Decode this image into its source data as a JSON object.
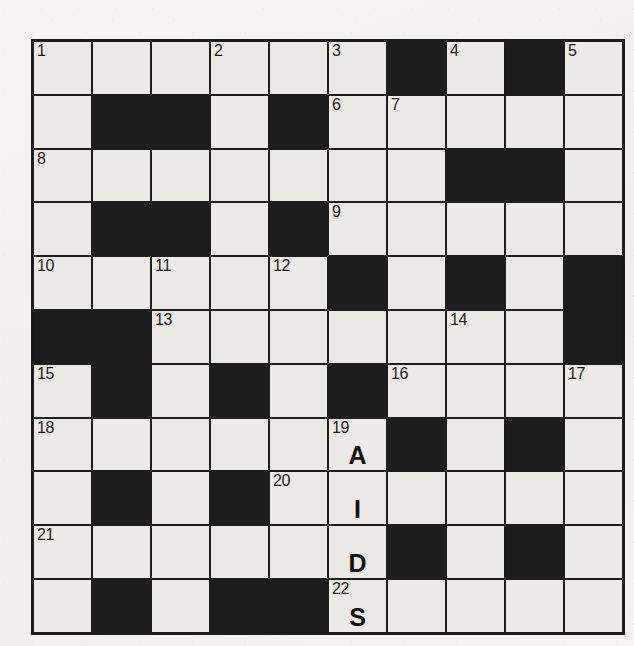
{
  "puzzle": {
    "title": "crossword-grid",
    "rows": 11,
    "cols": 10,
    "colors": {
      "block": "#1d1d1d",
      "cell": "#eceae6",
      "grid_line": "#1c1c1c",
      "paper": "#f3f2f0",
      "text": "#111111"
    },
    "filled_answer": "AIDS",
    "grid": [
      [
        {
          "block": false,
          "num": "1",
          "letter": ""
        },
        {
          "block": false,
          "num": "",
          "letter": ""
        },
        {
          "block": false,
          "num": "",
          "letter": ""
        },
        {
          "block": false,
          "num": "2",
          "letter": ""
        },
        {
          "block": false,
          "num": "",
          "letter": ""
        },
        {
          "block": false,
          "num": "3",
          "letter": ""
        },
        {
          "block": true,
          "num": "",
          "letter": ""
        },
        {
          "block": false,
          "num": "4",
          "letter": ""
        },
        {
          "block": true,
          "num": "",
          "letter": ""
        },
        {
          "block": false,
          "num": "5",
          "letter": ""
        }
      ],
      [
        {
          "block": false,
          "num": "",
          "letter": ""
        },
        {
          "block": true,
          "num": "",
          "letter": ""
        },
        {
          "block": true,
          "num": "",
          "letter": ""
        },
        {
          "block": false,
          "num": "",
          "letter": ""
        },
        {
          "block": true,
          "num": "",
          "letter": ""
        },
        {
          "block": false,
          "num": "6",
          "letter": ""
        },
        {
          "block": false,
          "num": "7",
          "letter": ""
        },
        {
          "block": false,
          "num": "",
          "letter": ""
        },
        {
          "block": false,
          "num": "",
          "letter": ""
        },
        {
          "block": false,
          "num": "",
          "letter": ""
        }
      ],
      [
        {
          "block": false,
          "num": "8",
          "letter": ""
        },
        {
          "block": false,
          "num": "",
          "letter": ""
        },
        {
          "block": false,
          "num": "",
          "letter": ""
        },
        {
          "block": false,
          "num": "",
          "letter": ""
        },
        {
          "block": false,
          "num": "",
          "letter": ""
        },
        {
          "block": false,
          "num": "",
          "letter": ""
        },
        {
          "block": false,
          "num": "",
          "letter": ""
        },
        {
          "block": true,
          "num": "",
          "letter": ""
        },
        {
          "block": true,
          "num": "",
          "letter": ""
        },
        {
          "block": false,
          "num": "",
          "letter": ""
        }
      ],
      [
        {
          "block": false,
          "num": "",
          "letter": ""
        },
        {
          "block": true,
          "num": "",
          "letter": ""
        },
        {
          "block": true,
          "num": "",
          "letter": ""
        },
        {
          "block": false,
          "num": "",
          "letter": ""
        },
        {
          "block": true,
          "num": "",
          "letter": ""
        },
        {
          "block": false,
          "num": "9",
          "letter": ""
        },
        {
          "block": false,
          "num": "",
          "letter": ""
        },
        {
          "block": false,
          "num": "",
          "letter": ""
        },
        {
          "block": false,
          "num": "",
          "letter": ""
        },
        {
          "block": false,
          "num": "",
          "letter": ""
        }
      ],
      [
        {
          "block": false,
          "num": "10",
          "letter": ""
        },
        {
          "block": false,
          "num": "",
          "letter": ""
        },
        {
          "block": false,
          "num": "11",
          "letter": ""
        },
        {
          "block": false,
          "num": "",
          "letter": ""
        },
        {
          "block": false,
          "num": "12",
          "letter": ""
        },
        {
          "block": true,
          "num": "",
          "letter": ""
        },
        {
          "block": false,
          "num": "",
          "letter": ""
        },
        {
          "block": true,
          "num": "",
          "letter": ""
        },
        {
          "block": false,
          "num": "",
          "letter": ""
        },
        {
          "block": true,
          "num": "",
          "letter": ""
        }
      ],
      [
        {
          "block": true,
          "num": "",
          "letter": ""
        },
        {
          "block": true,
          "num": "",
          "letter": ""
        },
        {
          "block": false,
          "num": "13",
          "letter": ""
        },
        {
          "block": false,
          "num": "",
          "letter": ""
        },
        {
          "block": false,
          "num": "",
          "letter": ""
        },
        {
          "block": false,
          "num": "",
          "letter": ""
        },
        {
          "block": false,
          "num": "",
          "letter": ""
        },
        {
          "block": false,
          "num": "14",
          "letter": ""
        },
        {
          "block": false,
          "num": "",
          "letter": ""
        },
        {
          "block": true,
          "num": "",
          "letter": ""
        }
      ],
      [
        {
          "block": false,
          "num": "15",
          "letter": ""
        },
        {
          "block": true,
          "num": "",
          "letter": ""
        },
        {
          "block": false,
          "num": "",
          "letter": ""
        },
        {
          "block": true,
          "num": "",
          "letter": ""
        },
        {
          "block": false,
          "num": "",
          "letter": ""
        },
        {
          "block": true,
          "num": "",
          "letter": ""
        },
        {
          "block": false,
          "num": "16",
          "letter": ""
        },
        {
          "block": false,
          "num": "",
          "letter": ""
        },
        {
          "block": false,
          "num": "",
          "letter": ""
        },
        {
          "block": false,
          "num": "17",
          "letter": ""
        }
      ],
      [
        {
          "block": false,
          "num": "18",
          "letter": ""
        },
        {
          "block": false,
          "num": "",
          "letter": ""
        },
        {
          "block": false,
          "num": "",
          "letter": ""
        },
        {
          "block": false,
          "num": "",
          "letter": ""
        },
        {
          "block": false,
          "num": "",
          "letter": ""
        },
        {
          "block": false,
          "num": "19",
          "letter": "A"
        },
        {
          "block": true,
          "num": "",
          "letter": ""
        },
        {
          "block": false,
          "num": "",
          "letter": ""
        },
        {
          "block": true,
          "num": "",
          "letter": ""
        },
        {
          "block": false,
          "num": "",
          "letter": ""
        }
      ],
      [
        {
          "block": false,
          "num": "",
          "letter": ""
        },
        {
          "block": true,
          "num": "",
          "letter": ""
        },
        {
          "block": false,
          "num": "",
          "letter": ""
        },
        {
          "block": true,
          "num": "",
          "letter": ""
        },
        {
          "block": false,
          "num": "20",
          "letter": ""
        },
        {
          "block": false,
          "num": "",
          "letter": "I"
        },
        {
          "block": false,
          "num": "",
          "letter": ""
        },
        {
          "block": false,
          "num": "",
          "letter": ""
        },
        {
          "block": false,
          "num": "",
          "letter": ""
        },
        {
          "block": false,
          "num": "",
          "letter": ""
        }
      ],
      [
        {
          "block": false,
          "num": "21",
          "letter": ""
        },
        {
          "block": false,
          "num": "",
          "letter": ""
        },
        {
          "block": false,
          "num": "",
          "letter": ""
        },
        {
          "block": false,
          "num": "",
          "letter": ""
        },
        {
          "block": false,
          "num": "",
          "letter": ""
        },
        {
          "block": false,
          "num": "",
          "letter": "D"
        },
        {
          "block": true,
          "num": "",
          "letter": ""
        },
        {
          "block": false,
          "num": "",
          "letter": ""
        },
        {
          "block": true,
          "num": "",
          "letter": ""
        },
        {
          "block": false,
          "num": "",
          "letter": ""
        }
      ],
      [
        {
          "block": false,
          "num": "",
          "letter": ""
        },
        {
          "block": true,
          "num": "",
          "letter": ""
        },
        {
          "block": false,
          "num": "",
          "letter": ""
        },
        {
          "block": true,
          "num": "",
          "letter": ""
        },
        {
          "block": true,
          "num": "",
          "letter": ""
        },
        {
          "block": false,
          "num": "22",
          "letter": "S"
        },
        {
          "block": false,
          "num": "",
          "letter": ""
        },
        {
          "block": false,
          "num": "",
          "letter": ""
        },
        {
          "block": false,
          "num": "",
          "letter": ""
        },
        {
          "block": false,
          "num": "",
          "letter": ""
        }
      ]
    ]
  }
}
